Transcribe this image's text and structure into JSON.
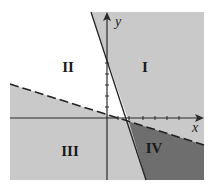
{
  "diagram": {
    "colors": {
      "background": "#ffffff",
      "light_region": "#c9c9c9",
      "dark_region": "#6e6e6e",
      "white_region": "#ffffff",
      "axis": "#2a2a2a",
      "line": "#222222"
    },
    "axes": {
      "x_label": "x",
      "y_label": "y"
    },
    "lines": [
      {
        "name": "solid-boundary-line",
        "style": "solid",
        "description": "steep negative slope line"
      },
      {
        "name": "dashed-boundary-line",
        "style": "dashed",
        "description": "shallow negative slope line"
      }
    ],
    "regions": [
      {
        "id": "I",
        "label": "I",
        "shade": "light"
      },
      {
        "id": "II",
        "label": "II",
        "shade": "white"
      },
      {
        "id": "III",
        "label": "III",
        "shade": "light"
      },
      {
        "id": "IV",
        "label": "IV",
        "shade": "dark"
      }
    ]
  }
}
